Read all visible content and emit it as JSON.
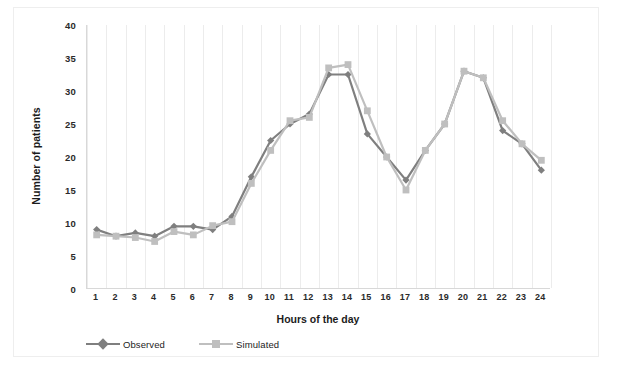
{
  "chart_data": {
    "type": "line",
    "title": "",
    "xlabel": "Hours of the  day",
    "ylabel": "Number of patients",
    "categories": [
      1,
      2,
      3,
      4,
      5,
      6,
      7,
      8,
      9,
      10,
      11,
      12,
      13,
      14,
      15,
      16,
      17,
      18,
      19,
      20,
      21,
      22,
      23,
      24
    ],
    "x": [
      1,
      2,
      3,
      4,
      5,
      6,
      7,
      8,
      9,
      10,
      11,
      12,
      13,
      14,
      15,
      16,
      17,
      18,
      19,
      20,
      21,
      22,
      23,
      24
    ],
    "xlim": [
      0.5,
      24.5
    ],
    "ylim": [
      0,
      40
    ],
    "yticks": [
      0,
      5,
      10,
      15,
      20,
      25,
      30,
      35,
      40
    ],
    "xticks": [
      "1",
      "2",
      "3",
      "4",
      "5",
      "6",
      "7",
      "8",
      "9",
      "10",
      "11",
      "12",
      "13",
      "14",
      "15",
      "16",
      "17",
      "18",
      "19",
      "20",
      "21",
      "22",
      "23",
      "24"
    ],
    "grid": "vertical-only",
    "legend_position": "bottom-left",
    "series": [
      {
        "name": "Observed",
        "color": "#7f7f7f",
        "marker": "diamond",
        "values": [
          9.0,
          8.0,
          8.5,
          8.0,
          9.5,
          9.5,
          9.0,
          11.0,
          17.0,
          22.5,
          25.0,
          26.5,
          32.5,
          32.5,
          23.5,
          20.0,
          16.5,
          21.0,
          25.0,
          33.0,
          32.0,
          24.0,
          22.0,
          18.0
        ]
      },
      {
        "name": "Simulated",
        "color": "#bfbfbf",
        "marker": "square",
        "values": [
          8.2,
          8.0,
          7.8,
          7.2,
          8.7,
          8.2,
          9.6,
          10.2,
          16.0,
          21.0,
          25.5,
          26.0,
          33.5,
          34.0,
          27.0,
          20.0,
          15.0,
          21.0,
          25.0,
          33.0,
          32.0,
          25.5,
          22.0,
          19.5
        ]
      }
    ]
  },
  "legend": {
    "items": [
      {
        "label": "Observed",
        "color": "#7f7f7f",
        "marker": "diamond"
      },
      {
        "label": "Simulated",
        "color": "#bfbfbf",
        "marker": "square"
      }
    ]
  }
}
